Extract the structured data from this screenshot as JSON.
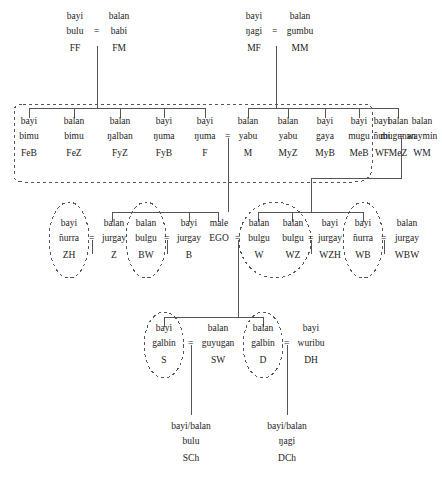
{
  "diagram": {
    "type": "kinship-genealogical-chart",
    "style": {
      "line_color": "#555555",
      "dash_color": "#555555",
      "text_color": "#1a1a1a",
      "background": "#ffffff"
    },
    "equals_sign": "=",
    "marriage_symbol": "=",
    "generations": [
      {
        "id": "g1",
        "label": "grandparents",
        "nodes": [
          {
            "id": "ff",
            "gender": "bayi",
            "term": "bulu",
            "abbr": "FF",
            "x": 75,
            "y": 12
          },
          {
            "id": "fm",
            "gender": "balan",
            "term": "babi",
            "abbr": "FM",
            "x": 119,
            "y": 12
          },
          {
            "id": "mf",
            "gender": "bayi",
            "term": "ŋagi",
            "abbr": "MF",
            "x": 254,
            "y": 12
          },
          {
            "id": "mm",
            "gender": "balan",
            "term": "gumbu",
            "abbr": "MM",
            "x": 298,
            "y": 12
          }
        ]
      },
      {
        "id": "g2",
        "label": "parents generation",
        "nodes": [
          {
            "id": "feb",
            "gender": "bayi",
            "term": "bimu",
            "abbr": "FeB",
            "x": 29,
            "y": 117
          },
          {
            "id": "fez",
            "gender": "balan",
            "term": "bimu",
            "abbr": "FeZ",
            "x": 74,
            "y": 117
          },
          {
            "id": "fyz",
            "gender": "balan",
            "term": "ŋalban",
            "abbr": "FyZ",
            "x": 120,
            "y": 117
          },
          {
            "id": "fyb",
            "gender": "bayi",
            "term": "ŋuma",
            "abbr": "FyB",
            "x": 164,
            "y": 117
          },
          {
            "id": "f",
            "gender": "bayi",
            "term": "ŋuma",
            "abbr": "F",
            "x": 205,
            "y": 117
          },
          {
            "id": "m",
            "gender": "balan",
            "term": "yabu",
            "abbr": "M",
            "x": 248,
            "y": 117
          },
          {
            "id": "myz",
            "gender": "balan",
            "term": "yabu",
            "abbr": "MyZ",
            "x": 288,
            "y": 117
          },
          {
            "id": "myb",
            "gender": "bayi",
            "term": "gaya",
            "abbr": "MyB",
            "x": 325,
            "y": 117
          },
          {
            "id": "meb",
            "gender": "bayi",
            "term": "mugu",
            "abbr": "MeB",
            "x": 359,
            "y": 117
          },
          {
            "id": "mez",
            "gender": "balan",
            "term": "mugunan",
            "abbr": "MeZ",
            "x": 398,
            "y": 117
          },
          {
            "id": "wf",
            "gender": "bayi",
            "term": "ñubi",
            "abbr": "WF",
            "x": 382,
            "y": 117
          },
          {
            "id": "wm",
            "gender": "balan",
            "term": "waymin",
            "abbr": "WM",
            "x": 419,
            "y": 117
          }
        ]
      },
      {
        "id": "g3",
        "label": "ego generation",
        "nodes": [
          {
            "id": "zh",
            "gender": "bayi",
            "term": "ñurra",
            "abbr": "ZH",
            "x": 69,
            "y": 219
          },
          {
            "id": "z",
            "gender": "balan",
            "term": "jurgay",
            "abbr": "Z",
            "x": 112,
            "y": 219
          },
          {
            "id": "bw",
            "gender": "balan",
            "term": "bulgu",
            "abbr": "BW",
            "x": 146,
            "y": 219
          },
          {
            "id": "b",
            "gender": "bayi",
            "term": "jurgay",
            "abbr": "B",
            "x": 189,
            "y": 219
          },
          {
            "id": "ego",
            "gender": "male",
            "term": "EGO",
            "abbr": "",
            "x": 218,
            "y": 219
          },
          {
            "id": "w",
            "gender": "balan",
            "term": "bulgu",
            "abbr": "W",
            "x": 258,
            "y": 219
          },
          {
            "id": "wz",
            "gender": "balan",
            "term": "bulgu",
            "abbr": "WZ",
            "x": 292,
            "y": 219
          },
          {
            "id": "wzh",
            "gender": "bayi",
            "term": "jurgay",
            "abbr": "WZH",
            "x": 329,
            "y": 219
          },
          {
            "id": "wb",
            "gender": "bayi",
            "term": "ñurra",
            "abbr": "WB",
            "x": 363,
            "y": 219
          },
          {
            "id": "wbw",
            "gender": "balan",
            "term": "jurgay",
            "abbr": "WBW",
            "x": 404,
            "y": 219
          }
        ]
      },
      {
        "id": "g4",
        "label": "children generation",
        "nodes": [
          {
            "id": "s",
            "gender": "bayi",
            "term": "galbin",
            "abbr": "S",
            "x": 164,
            "y": 324
          },
          {
            "id": "sw",
            "gender": "balan",
            "term": "guyugan",
            "abbr": "SW",
            "x": 218,
            "y": 324
          },
          {
            "id": "d",
            "gender": "balan",
            "term": "galbin",
            "abbr": "D",
            "x": 263,
            "y": 324
          },
          {
            "id": "dh",
            "gender": "bayi",
            "term": "wuribu",
            "abbr": "DH",
            "x": 311,
            "y": 324
          }
        ]
      },
      {
        "id": "g5",
        "label": "grandchildren generation",
        "nodes": [
          {
            "id": "sch",
            "gender": "bayi/balan",
            "term": "bulu",
            "abbr": "SCh",
            "x": 186,
            "y": 422
          },
          {
            "id": "dch",
            "gender": "bayi/balan",
            "term": "ŋagi",
            "abbr": "DCh",
            "x": 288,
            "y": 422
          }
        ]
      }
    ],
    "marriages": [
      {
        "id": "m-ff-fm",
        "left": "ff",
        "right": "fm",
        "x": 97,
        "y": 38
      },
      {
        "id": "m-mf-mm",
        "left": "mf",
        "right": "mm",
        "x": 276,
        "y": 38
      },
      {
        "id": "m-f-m",
        "left": "f",
        "right": "m",
        "x": 228,
        "y": 143
      },
      {
        "id": "m-wf-wm",
        "left": "wf",
        "right": "wm",
        "x": 401,
        "y": 143
      },
      {
        "id": "m-zh-z",
        "left": "zh",
        "right": "z",
        "x": 92,
        "y": 245
      },
      {
        "id": "m-bw-b",
        "left": "bw",
        "right": "b",
        "x": 167,
        "y": 245
      },
      {
        "id": "m-ego-w",
        "left": "ego",
        "right": "w",
        "x": 238,
        "y": 245
      },
      {
        "id": "m-wz-wzh",
        "left": "wz",
        "right": "wzh",
        "x": 311,
        "y": 245
      },
      {
        "id": "m-wb-wbw",
        "left": "wb",
        "right": "wbw",
        "x": 384,
        "y": 245
      },
      {
        "id": "m-s-sw",
        "left": "s",
        "right": "sw",
        "x": 191,
        "y": 350
      },
      {
        "id": "m-d-dh",
        "left": "d",
        "right": "dh",
        "x": 287,
        "y": 350
      }
    ],
    "groupings": [
      {
        "id": "dashed-box-parents",
        "shape": "rounded-rect",
        "note": "parents generation consanguines"
      },
      {
        "id": "ellipse-zh",
        "shape": "ellipse",
        "member": "zh"
      },
      {
        "id": "ellipse-bw",
        "shape": "ellipse",
        "member": "bw"
      },
      {
        "id": "ellipse-w-wz",
        "shape": "ellipse",
        "members": [
          "w",
          "wz"
        ]
      },
      {
        "id": "ellipse-wb",
        "shape": "ellipse",
        "member": "wb"
      },
      {
        "id": "ellipse-s",
        "shape": "ellipse",
        "member": "s"
      },
      {
        "id": "ellipse-d",
        "shape": "ellipse",
        "member": "d"
      }
    ]
  }
}
